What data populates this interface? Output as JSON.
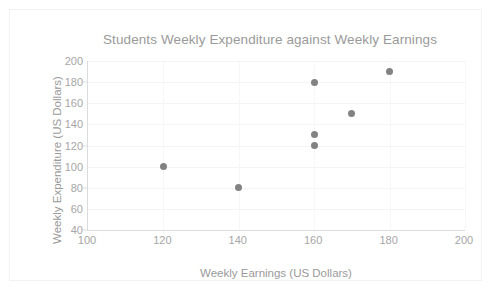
{
  "chart_data": {
    "type": "scatter",
    "title": "Students Weekly Expenditure against Weekly Earnings",
    "xlabel": "Weekly Earnings (US Dollars)",
    "ylabel": "Weekly Expenditure (US Dollars)",
    "xlim": [
      100,
      200
    ],
    "ylim": [
      40,
      200
    ],
    "xticks": [
      100,
      120,
      140,
      160,
      180,
      200
    ],
    "yticks": [
      40,
      60,
      80,
      100,
      120,
      140,
      160,
      180,
      200
    ],
    "xtick_labels": [
      "100",
      "120",
      "140",
      "160",
      "180",
      "200"
    ],
    "ytick_labels": [
      "40",
      "60",
      "80",
      "100",
      "120",
      "140",
      "160",
      "180",
      "200"
    ],
    "grid": true,
    "legend": false,
    "legend_position": "none",
    "marker_color": "#828282",
    "text_color": "#9a9a9a",
    "gridline_color": "#f4f4f4",
    "axis_color": "#dcdcdc",
    "series": [
      {
        "name": "Students",
        "points": [
          {
            "x": 120,
            "y": 100
          },
          {
            "x": 140,
            "y": 80
          },
          {
            "x": 160,
            "y": 180
          },
          {
            "x": 160,
            "y": 130
          },
          {
            "x": 160,
            "y": 120
          },
          {
            "x": 170,
            "y": 150
          },
          {
            "x": 180,
            "y": 190
          }
        ]
      }
    ]
  }
}
